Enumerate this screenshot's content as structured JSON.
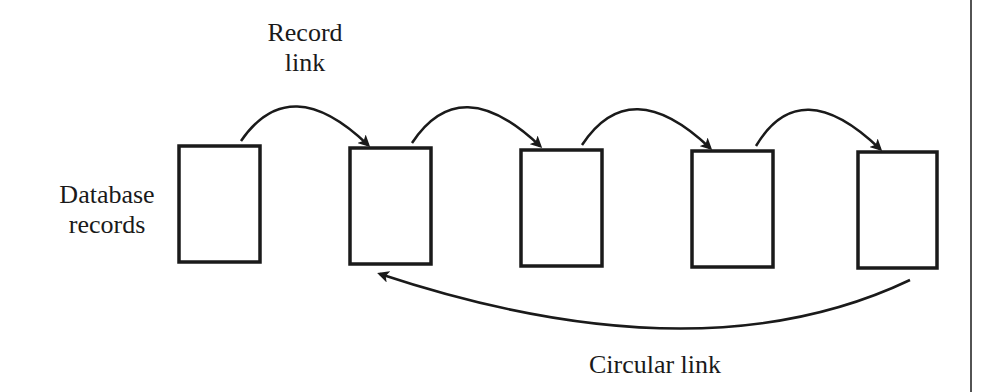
{
  "diagram": {
    "labels": {
      "record_link": [
        "Record",
        "link"
      ],
      "database_records": [
        "Database",
        "records"
      ],
      "circular_link": "Circular link"
    },
    "records": [
      {
        "id": 1,
        "x": 179,
        "y": 146,
        "w": 81,
        "h": 116
      },
      {
        "id": 2,
        "x": 350,
        "y": 148,
        "w": 81,
        "h": 116
      },
      {
        "id": 3,
        "x": 521,
        "y": 150,
        "w": 81,
        "h": 116
      },
      {
        "id": 4,
        "x": 692,
        "y": 151,
        "w": 81,
        "h": 116
      },
      {
        "id": 5,
        "x": 858,
        "y": 152,
        "w": 79,
        "h": 116
      }
    ],
    "links": [
      {
        "from": 1,
        "to": 2,
        "type": "record-link"
      },
      {
        "from": 2,
        "to": 3,
        "type": "record-link"
      },
      {
        "from": 3,
        "to": 4,
        "type": "record-link"
      },
      {
        "from": 4,
        "to": 5,
        "type": "record-link"
      },
      {
        "from": 5,
        "to": 2,
        "type": "circular-link"
      }
    ],
    "colors": {
      "stroke": "#1a1a1a",
      "background": "#ffffff"
    }
  }
}
